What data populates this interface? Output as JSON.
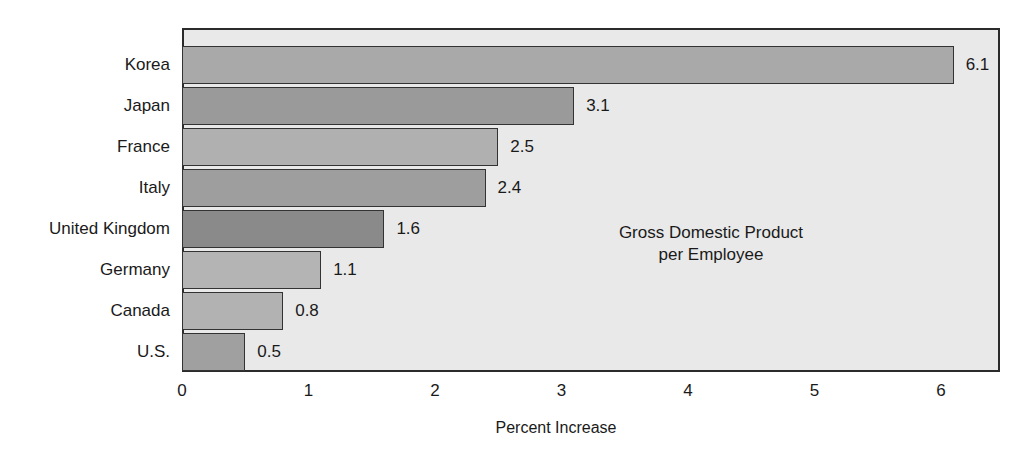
{
  "chart_data": {
    "type": "bar",
    "orientation": "horizontal",
    "title": "",
    "annotation": [
      "Gross Domestic Product",
      "per Employee"
    ],
    "xlabel": "Percent Increase",
    "ylabel": "",
    "xlim": [
      0,
      6.5
    ],
    "xticks": [
      "0",
      "1",
      "2",
      "3",
      "4",
      "5",
      "6"
    ],
    "xtick_values": [
      0,
      1,
      2,
      3,
      4,
      5,
      6
    ],
    "grid": false,
    "legend": false,
    "categories": [
      "Korea",
      "Japan",
      "France",
      "Italy",
      "United Kingdom",
      "Germany",
      "Canada",
      "U.S."
    ],
    "values": [
      6.1,
      3.1,
      2.5,
      2.4,
      1.6,
      1.1,
      0.8,
      0.5
    ],
    "value_labels": [
      "6.1",
      "3.1",
      "2.5",
      "2.4",
      "1.6",
      "1.1",
      "0.8",
      "0.5"
    ],
    "bar_colors": [
      "#a9a9a9",
      "#9a9a9a",
      "#b0b0b0",
      "#9e9e9e",
      "#8a8a8a",
      "#b4b4b4",
      "#b2b2b2",
      "#a0a0a0"
    ],
    "bars": [
      {
        "label": "Korea",
        "value": 6.1,
        "value_label": "6.1",
        "color": "#a9a9a9"
      },
      {
        "label": "Japan",
        "value": 3.1,
        "value_label": "3.1",
        "color": "#9a9a9a"
      },
      {
        "label": "France",
        "value": 2.5,
        "value_label": "2.5",
        "color": "#b0b0b0"
      },
      {
        "label": "Italy",
        "value": 2.4,
        "value_label": "2.4",
        "color": "#9e9e9e"
      },
      {
        "label": "United Kingdom",
        "value": 1.6,
        "value_label": "1.6",
        "color": "#8a8a8a"
      },
      {
        "label": "Germany",
        "value": 1.1,
        "value_label": "1.1",
        "color": "#b4b4b4"
      },
      {
        "label": "Canada",
        "value": 0.8,
        "value_label": "0.8",
        "color": "#b2b2b2"
      },
      {
        "label": "U.S.",
        "value": 0.5,
        "value_label": "0.5",
        "color": "#a0a0a0"
      }
    ],
    "plot_background": "#e9e9e9",
    "axis_color": "#2b2b2b",
    "text_color": "#1a1a1a"
  }
}
